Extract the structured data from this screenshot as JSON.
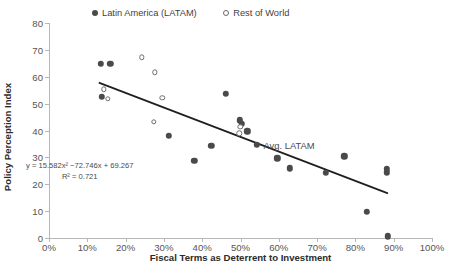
{
  "chart_data": {
    "type": "scatter",
    "title": "",
    "xlabel": "Fiscal Terms as Deterrent to Investment",
    "ylabel": "Policy Perception Index",
    "xlim": [
      0,
      100
    ],
    "ylim": [
      0,
      80
    ],
    "x_ticks": [
      "0%",
      "10%",
      "20%",
      "30%",
      "40%",
      "50%",
      "60%",
      "70%",
      "80%",
      "90%",
      "100%"
    ],
    "x_tick_values": [
      0,
      10,
      20,
      30,
      40,
      50,
      60,
      70,
      80,
      90,
      100
    ],
    "y_ticks": [
      "0",
      "10",
      "20",
      "30",
      "40",
      "50",
      "60",
      "70",
      "80"
    ],
    "y_tick_values": [
      0,
      10,
      20,
      30,
      40,
      50,
      60,
      70,
      80
    ],
    "grid": false,
    "legend_position": "top-center",
    "series": [
      {
        "name": "Latin America (LATAM)",
        "marker": "filled-circle",
        "color": "#4a4a4a",
        "points": [
          {
            "x": 13.6,
            "y": 64.8
          },
          {
            "x": 16.0,
            "y": 64.8
          },
          {
            "x": 13.8,
            "y": 52.6
          },
          {
            "x": 31.3,
            "y": 38.1
          },
          {
            "x": 37.9,
            "y": 28.7
          },
          {
            "x": 42.4,
            "y": 34.4
          },
          {
            "x": 46.2,
            "y": 53.7
          },
          {
            "x": 49.8,
            "y": 43.8
          },
          {
            "x": 50.3,
            "y": 42.6
          },
          {
            "x": 51.8,
            "y": 39.7
          },
          {
            "x": 54.2,
            "y": 34.6
          },
          {
            "x": 59.6,
            "y": 29.6
          },
          {
            "x": 62.9,
            "y": 25.9
          },
          {
            "x": 72.2,
            "y": 24.3
          },
          {
            "x": 77.1,
            "y": 30.4
          },
          {
            "x": 83.0,
            "y": 9.8
          },
          {
            "x": 88.2,
            "y": 25.8
          },
          {
            "x": 88.2,
            "y": 24.4
          },
          {
            "x": 88.4,
            "y": 0.6
          }
        ]
      },
      {
        "name": "Rest of World",
        "marker": "hollow-circle",
        "color": "#6e6e6e",
        "points": [
          {
            "x": 14.3,
            "y": 55.4
          },
          {
            "x": 15.4,
            "y": 51.9
          },
          {
            "x": 24.2,
            "y": 67.3
          },
          {
            "x": 27.6,
            "y": 61.7
          },
          {
            "x": 27.4,
            "y": 43.3
          },
          {
            "x": 29.6,
            "y": 52.1
          },
          {
            "x": 49.9,
            "y": 41.3
          },
          {
            "x": 49.7,
            "y": 38.9
          }
        ]
      }
    ],
    "trendline": {
      "equation": "y = 15.582x² −72.746x + 69.267",
      "r_squared": "R² = 0.721",
      "x_start": 13.0,
      "y_start": 57.8,
      "x_end": 88.5,
      "y_end": 16.6,
      "color": "#1f1f1f"
    },
    "annotations": [
      {
        "text": "Avg. LATAM",
        "x": 56.0,
        "y": 34.6,
        "name": "avg-latam-label"
      }
    ]
  }
}
